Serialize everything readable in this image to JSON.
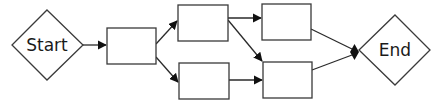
{
  "diagram": {
    "type": "flowchart",
    "colors": {
      "stroke": "#3a3a3a",
      "fill": "#ffffff",
      "arrow": "#111111",
      "text": "#1a1a1a"
    },
    "nodes": [
      {
        "id": "start",
        "shape": "diamond",
        "label": "Start"
      },
      {
        "id": "box1",
        "shape": "rectangle",
        "label": ""
      },
      {
        "id": "box2",
        "shape": "rectangle",
        "label": ""
      },
      {
        "id": "box3",
        "shape": "rectangle",
        "label": ""
      },
      {
        "id": "box4",
        "shape": "rectangle",
        "label": ""
      },
      {
        "id": "box5",
        "shape": "rectangle",
        "label": ""
      },
      {
        "id": "end",
        "shape": "diamond",
        "label": "End"
      }
    ],
    "edges": [
      {
        "from": "start",
        "to": "box1",
        "head": "arrow"
      },
      {
        "from": "box1",
        "to": "box2",
        "head": "arrow"
      },
      {
        "from": "box1",
        "to": "box3",
        "head": "arrow"
      },
      {
        "from": "box2",
        "to": "box4",
        "head": "arrow"
      },
      {
        "from": "box2",
        "to": "box5",
        "head": "arrow"
      },
      {
        "from": "box3",
        "to": "box5",
        "head": "arrow"
      },
      {
        "from": "box4",
        "to": "end",
        "head": "diamond-join"
      },
      {
        "from": "box5",
        "to": "end",
        "head": "diamond-join"
      }
    ]
  }
}
